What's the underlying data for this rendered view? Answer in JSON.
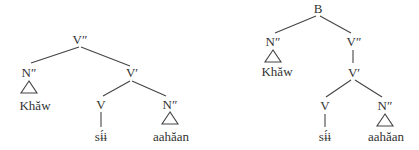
{
  "trees": [
    {
      "name": "tree-left",
      "nodes": {
        "root": {
          "label": "V″"
        },
        "subj": {
          "label": "N″"
        },
        "vbar": {
          "label": "V′"
        },
        "subj_word": {
          "label": "Khăw"
        },
        "verb": {
          "label": "V"
        },
        "obj": {
          "label": "N″"
        },
        "verb_word": {
          "label": "sɨ́ɨ"
        },
        "obj_word": {
          "label": "aahăan"
        }
      }
    },
    {
      "name": "tree-right",
      "nodes": {
        "root": {
          "label": "B"
        },
        "subj": {
          "label": "N″"
        },
        "vp": {
          "label": "V″"
        },
        "subj_word": {
          "label": "Khăw"
        },
        "vbar": {
          "label": "V′"
        },
        "verb": {
          "label": "V"
        },
        "obj": {
          "label": "N″"
        },
        "verb_word": {
          "label": "sɨ́ɨ"
        },
        "obj_word": {
          "label": "aahăan"
        }
      }
    }
  ]
}
